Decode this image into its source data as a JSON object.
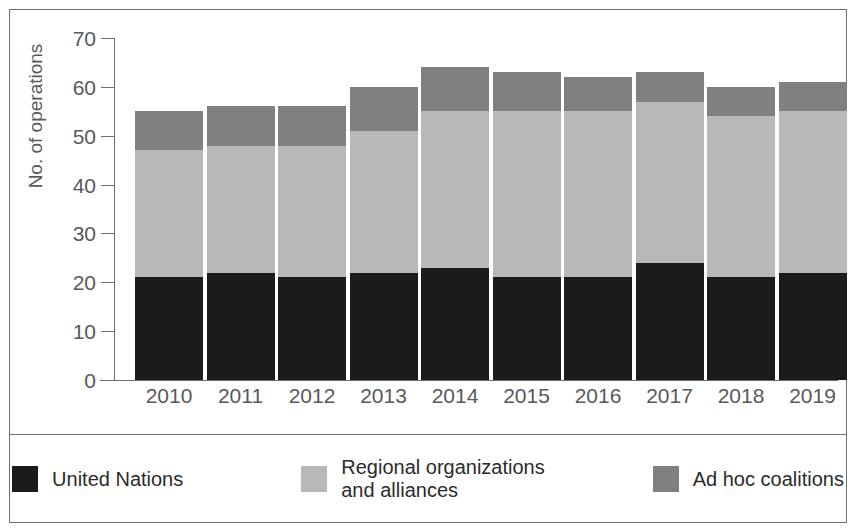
{
  "chart_data": {
    "type": "bar",
    "subtype": "stacked-bar",
    "title": "",
    "xlabel": "",
    "ylabel": "No. of operations",
    "ylim": [
      0,
      70
    ],
    "yticks": [
      0,
      10,
      20,
      30,
      40,
      50,
      60,
      70
    ],
    "grid": false,
    "legend_position": "bottom",
    "categories": [
      "2010",
      "2011",
      "2012",
      "2013",
      "2014",
      "2015",
      "2016",
      "2017",
      "2018",
      "2019"
    ],
    "series": [
      {
        "name": "United Nations",
        "color": "#1b1b1b",
        "values": [
          21,
          22,
          21,
          22,
          23,
          21,
          21,
          24,
          21,
          22
        ]
      },
      {
        "name": "Regional organizations and alliances",
        "color": "#b8b8b8",
        "values": [
          26,
          26,
          27,
          29,
          32,
          34,
          34,
          33,
          33,
          33
        ]
      },
      {
        "name": "Ad hoc coalitions",
        "color": "#808080",
        "values": [
          8,
          8,
          8,
          9,
          9,
          8,
          7,
          6,
          6,
          6
        ]
      }
    ],
    "totals": [
      55,
      56,
      56,
      60,
      64,
      63,
      62,
      63,
      60,
      61
    ],
    "cumulative_tops": {
      "united_nations": [
        21,
        22,
        21,
        22,
        23,
        21,
        21,
        24,
        21,
        22
      ],
      "plus_regional": [
        47,
        48,
        48,
        51,
        55,
        55,
        55,
        57,
        54,
        55
      ],
      "plus_adhoc": [
        55,
        56,
        56,
        60,
        64,
        63,
        62,
        63,
        60,
        61
      ]
    }
  },
  "axes": {
    "y_title": "No. of operations",
    "y_tick_labels": [
      "0",
      "10",
      "20",
      "30",
      "40",
      "50",
      "60",
      "70"
    ],
    "x_tick_labels": [
      "2010",
      "2011",
      "2012",
      "2013",
      "2014",
      "2015",
      "2016",
      "2017",
      "2018",
      "2019"
    ]
  },
  "legend": {
    "items": [
      {
        "label": "United Nations",
        "color": "#1b1b1b"
      },
      {
        "label": "Regional organizations\nand alliances",
        "color": "#b8b8b8"
      },
      {
        "label": "Ad hoc coalitions",
        "color": "#808080"
      }
    ]
  },
  "colors": {
    "united_nations": "#1b1b1b",
    "regional": "#b8b8b8",
    "ad_hoc": "#808080",
    "axis": "#6e6e6e",
    "tick_text": "#58595b",
    "legend_text": "#2b2b2b",
    "background": "#ffffff"
  }
}
